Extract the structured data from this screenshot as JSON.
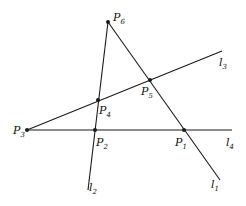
{
  "diagram": {
    "type": "geometry",
    "stroke_color": "#1a1a1a",
    "points": [
      {
        "id": "P1",
        "label": "P",
        "sub": "1",
        "x": 184,
        "y": 130,
        "lx": 175,
        "ly": 146
      },
      {
        "id": "P2",
        "label": "P",
        "sub": "2",
        "x": 95,
        "y": 130,
        "lx": 96,
        "ly": 146
      },
      {
        "id": "P3",
        "label": "P",
        "sub": "3",
        "x": 27,
        "y": 130,
        "lx": 13,
        "ly": 134
      },
      {
        "id": "P4",
        "label": "P",
        "sub": "4",
        "x": 98,
        "y": 100,
        "lx": 99,
        "ly": 114
      },
      {
        "id": "P5",
        "label": "P",
        "sub": "5",
        "x": 150,
        "y": 80,
        "lx": 141,
        "ly": 95
      },
      {
        "id": "P6",
        "label": "P",
        "sub": "6",
        "x": 108,
        "y": 22,
        "lx": 113,
        "ly": 21
      }
    ],
    "lines": [
      {
        "id": "l1",
        "label": "l",
        "sub": "1",
        "x1": 108,
        "y1": 22,
        "x2": 220,
        "y2": 180,
        "lx": 211,
        "ly": 188
      },
      {
        "id": "l2",
        "label": "l",
        "sub": "2",
        "x1": 108,
        "y1": 22,
        "x2": 88,
        "y2": 190,
        "lx": 89,
        "ly": 191
      },
      {
        "id": "l3",
        "label": "l",
        "sub": "3",
        "x1": 27,
        "y1": 130,
        "x2": 222,
        "y2": 51,
        "lx": 219,
        "ly": 66
      },
      {
        "id": "l4",
        "label": "l",
        "sub": "4",
        "x1": 27,
        "y1": 130,
        "x2": 232,
        "y2": 130,
        "lx": 226,
        "ly": 146
      }
    ]
  }
}
